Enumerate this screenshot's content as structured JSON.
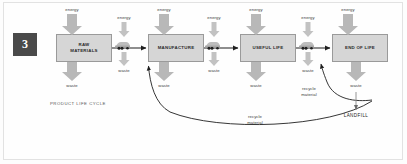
{
  "diagram": {
    "badge": "3",
    "caption": "PRODUCT LIFE CYCLE",
    "landfill_label": "LANDFILL",
    "colors": {
      "box_fill": "#d6d6d6",
      "box_stroke": "#9a9a9a",
      "arrow_gray": "#b3b3b3",
      "line_dark": "#1f1f1f",
      "badge_bg": "#4a4a4a",
      "text": "#2b2b2b"
    },
    "stages": [
      {
        "id": "raw-materials",
        "line1": "RAW",
        "line2": "MATERIALS",
        "x": 56,
        "y": 34,
        "w": 56
      },
      {
        "id": "manufacture",
        "line1": "MANUFACTURE",
        "line2": "",
        "x": 148,
        "y": 34,
        "w": 56
      },
      {
        "id": "useful-life",
        "line1": "USEFUL LIFE",
        "line2": "",
        "x": 240,
        "y": 34,
        "w": 56
      },
      {
        "id": "end-of-life",
        "line1": "END OF LIFE",
        "line2": "",
        "x": 332,
        "y": 34,
        "w": 56
      }
    ],
    "energy_inputs": [
      {
        "label": "energy",
        "x": 72,
        "size": "large"
      },
      {
        "label": "energy",
        "x": 124,
        "size": "small"
      },
      {
        "label": "energy",
        "x": 164,
        "size": "large"
      },
      {
        "label": "energy",
        "x": 214,
        "size": "small"
      },
      {
        "label": "energy",
        "x": 256,
        "size": "large"
      },
      {
        "label": "energy",
        "x": 308,
        "size": "small"
      },
      {
        "label": "energy",
        "x": 348,
        "size": "large"
      }
    ],
    "waste_outputs": [
      {
        "label": "waste",
        "x": 72,
        "size": "large"
      },
      {
        "label": "waste",
        "x": 124,
        "size": "small"
      },
      {
        "label": "waste",
        "x": 164,
        "size": "large"
      },
      {
        "label": "waste",
        "x": 214,
        "size": "small"
      },
      {
        "label": "waste",
        "x": 256,
        "size": "large"
      },
      {
        "label": "waste",
        "x": 308,
        "size": "small"
      },
      {
        "label": "waste",
        "x": 356,
        "size": "large"
      }
    ],
    "recycle_flows": [
      {
        "label_line1": "recycle",
        "label_line2": "material",
        "label_x": 309,
        "label_y": 88
      },
      {
        "label_line1": "recycle",
        "label_line2": "material",
        "label_x": 255,
        "label_y": 116
      }
    ],
    "transport_icons": [
      {
        "id": "truck-1",
        "x": 124
      },
      {
        "id": "truck-2",
        "x": 214
      },
      {
        "id": "truck-3",
        "x": 308
      }
    ]
  }
}
